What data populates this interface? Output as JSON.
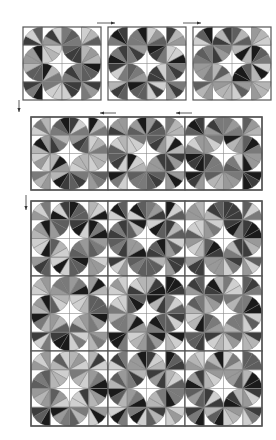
{
  "diagram": {
    "cell_pattern": "Each 4x4 block of quarter-circle wedges forms a ring of arcs around a white four-pointed star center",
    "colors": {
      "background": "#ffffff",
      "block_border": "#555555",
      "seam": "#8a8a8a",
      "arrow": "#333333",
      "shades": [
        "#1a1a1a",
        "#3c3c3c",
        "#5e5e5e",
        "#7a7a7a",
        "#999999",
        "#b5b5b5",
        "#cfcfcf"
      ]
    },
    "cell_corners": [
      [
        "BR",
        "BR",
        "BL",
        "BL"
      ],
      [
        "BR",
        "TL",
        "TR",
        "BL"
      ],
      [
        "TR",
        "BL",
        "BR",
        "TL"
      ],
      [
        "TR",
        "TR",
        "TL",
        "TL"
      ]
    ],
    "stages": [
      {
        "name": "stage-1-row-of-blocks",
        "x": 23,
        "y": 27,
        "block_w": 78,
        "block_h": 73,
        "gap": 7,
        "cols": 3,
        "rows": 1,
        "joined": false
      },
      {
        "name": "stage-2-joined-row",
        "x": 31,
        "y": 117,
        "block_w": 77,
        "block_h": 73,
        "gap": 0,
        "cols": 3,
        "rows": 1,
        "joined": true
      },
      {
        "name": "stage-3-assembled-quilt",
        "x": 31,
        "y": 201,
        "block_w": 77,
        "block_h": 75,
        "gap": 0,
        "cols": 3,
        "rows": 3,
        "joined": true
      }
    ],
    "arrows": [
      {
        "name": "arrow-right-1",
        "dir": "right",
        "x1": 97,
        "y1": 23,
        "x2": 115,
        "y2": 23
      },
      {
        "name": "arrow-right-2",
        "dir": "right",
        "x1": 183,
        "y1": 23,
        "x2": 201,
        "y2": 23
      },
      {
        "name": "arrow-down-1",
        "dir": "down",
        "x1": 19,
        "y1": 100,
        "x2": 19,
        "y2": 112
      },
      {
        "name": "arrow-left-1",
        "dir": "left",
        "x1": 116,
        "y1": 113,
        "x2": 100,
        "y2": 113
      },
      {
        "name": "arrow-left-2",
        "dir": "left",
        "x1": 192,
        "y1": 113,
        "x2": 176,
        "y2": 113
      },
      {
        "name": "arrow-down-2",
        "dir": "down",
        "x1": 26,
        "y1": 195,
        "x2": 26,
        "y2": 210
      }
    ],
    "block_seeds": [
      3,
      7,
      11,
      5,
      9,
      2,
      13,
      17,
      19,
      23,
      29,
      31,
      37,
      41,
      43
    ]
  }
}
